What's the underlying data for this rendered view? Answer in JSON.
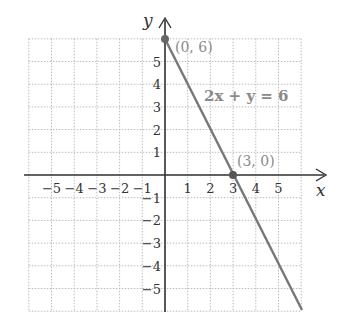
{
  "chart_data": {
    "type": "line",
    "title": "",
    "xlabel": "x",
    "ylabel": "y",
    "xlim": [
      -6,
      6
    ],
    "ylim": [
      -6,
      6
    ],
    "grid": true,
    "x_ticks": [
      "−5",
      "−4",
      "−3",
      "−2",
      "−1",
      "1",
      "2",
      "3",
      "4",
      "5"
    ],
    "y_ticks": [
      "5",
      "4",
      "3",
      "2",
      "1",
      "−1",
      "−2",
      "−3",
      "−4",
      "−5"
    ],
    "series": [
      {
        "name": "2x + y = 6",
        "x": [
          0,
          3,
          6
        ],
        "y": [
          6,
          0,
          -6
        ],
        "color": "#777777"
      }
    ],
    "points": [
      {
        "label": "(0, 6)",
        "x": 0,
        "y": 6
      },
      {
        "label": "(3, 0)",
        "x": 3,
        "y": 0
      }
    ],
    "annotations": [
      {
        "text": "2x + y = 6",
        "x": 3.6,
        "y": 3.6
      }
    ]
  },
  "labels": {
    "x_axis": "x",
    "y_axis": "y",
    "equation": "2x + y = 6",
    "point_a": "(0, 6)",
    "point_b": "(3, 0)"
  },
  "colors": {
    "axis": "#333333",
    "grid": "#bbbbbb",
    "line": "#777777",
    "point": "#666666",
    "annotation": "#8a8a8a"
  }
}
